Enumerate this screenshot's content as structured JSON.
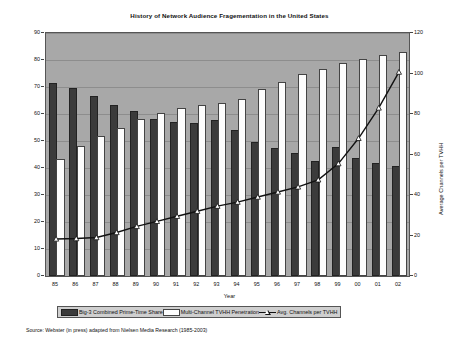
{
  "chart_data": {
    "type": "bar",
    "title": "History of Network Audience Fragementation in the United States",
    "xlabel": "Year",
    "ylabel": "Percent",
    "y2label": "Average Channels per TVHH",
    "categories": [
      "85",
      "86",
      "87",
      "88",
      "89",
      "90",
      "91",
      "92",
      "93",
      "94",
      "95",
      "96",
      "97",
      "98",
      "99",
      "00",
      "01",
      "02"
    ],
    "ylim": [
      0,
      90
    ],
    "yticks": [
      0,
      10,
      20,
      30,
      40,
      50,
      60,
      70,
      80,
      90
    ],
    "y2lim": [
      0,
      120
    ],
    "y2ticks": [
      0,
      20,
      40,
      60,
      80,
      100,
      120
    ],
    "grid": true,
    "legend_position": "bottom",
    "series": [
      {
        "name": "Big-3 Combined Prime-Time Share",
        "type": "bar",
        "axis": "left",
        "color": "#3b3b3b",
        "values": [
          70.7,
          68.9,
          65.9,
          62.5,
          60.5,
          57.5,
          56.3,
          56.0,
          57.0,
          53.2,
          49.0,
          46.5,
          45.0,
          42.0,
          47.0,
          43.0,
          41.0,
          40.0
        ]
      },
      {
        "name": "Multi-Channel TVHH Penetration",
        "type": "bar",
        "axis": "left",
        "color": "#fdfdfd",
        "values": [
          42.6,
          47.5,
          51.0,
          54.0,
          57.5,
          59.5,
          61.5,
          62.5,
          63.5,
          65.0,
          68.5,
          71.0,
          74.0,
          76.0,
          78.0,
          79.5,
          81.0,
          82.2
        ]
      },
      {
        "name": "Avg. Channels per TVHH",
        "type": "line",
        "axis": "right",
        "color": "#111111",
        "marker": "triangle",
        "values": [
          18.3,
          18.5,
          19.0,
          21.5,
          24.5,
          27.0,
          29.5,
          32.0,
          34.5,
          36.5,
          39.0,
          41.5,
          44.0,
          47.5,
          55.5,
          68.0,
          83.0,
          100.7
        ]
      }
    ],
    "source": "Source: Webster (in press) adapted from Nielsen Media Research (1985-2003)",
    "plot_background": "#a8a8a8"
  }
}
